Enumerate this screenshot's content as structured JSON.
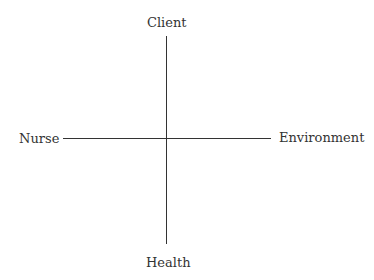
{
  "diagram": {
    "nodes": {
      "top": "Client",
      "left": "Nurse",
      "right": "Environment",
      "bottom": "Health"
    },
    "line_color": "#333333"
  }
}
